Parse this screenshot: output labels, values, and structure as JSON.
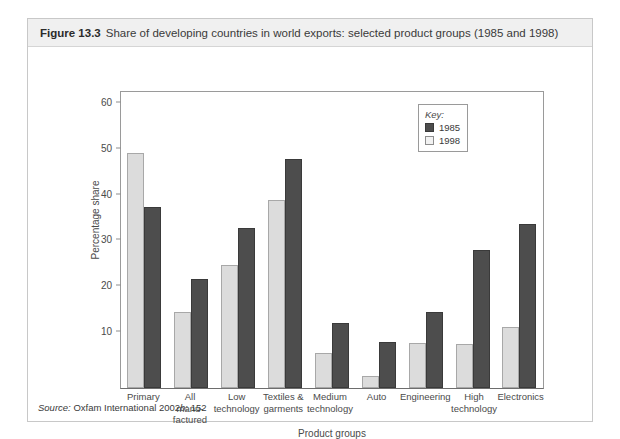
{
  "caption": {
    "figure_label": "Figure 13.3",
    "figure_text": "Share of developing countries in world exports: selected product groups (1985 and 1998)"
  },
  "source": {
    "label": "Source:",
    "text": "Oxfam International 2002",
    "italic_suffix": "b",
    "page": ": 152"
  },
  "legend": {
    "title": "Key:",
    "entries": [
      {
        "label": "1985",
        "color": "#4d4d4d"
      },
      {
        "label": "1998",
        "color": "#f2f2f2"
      }
    ]
  },
  "chart_data": {
    "type": "bar",
    "title": "Share of developing countries in world exports: selected product groups (1985 and 1998)",
    "xlabel": "Product groups",
    "ylabel": "Percentage share",
    "ylim": [
      0,
      65
    ],
    "yticks": [
      10,
      20,
      30,
      40,
      50,
      60
    ],
    "grid": false,
    "legend_position": "top-right",
    "categories": [
      "Primary",
      "All manu-factured",
      "Low technology",
      "Textiles & garments",
      "Medium technology",
      "Auto",
      "Engineering",
      "High technology",
      "Electronics"
    ],
    "category_lines": [
      [
        "Primary"
      ],
      [
        "All",
        "manu-",
        "factured"
      ],
      [
        "Low",
        "technology"
      ],
      [
        "Textiles &",
        "garments"
      ],
      [
        "Medium",
        "technology"
      ],
      [
        "Auto"
      ],
      [
        "Engineering"
      ],
      [
        "High",
        "technology"
      ],
      [
        "Electronics"
      ]
    ],
    "series": [
      {
        "name": "1998",
        "color": "#dcdcdc",
        "values": [
          51.3,
          16.5,
          26.8,
          41.0,
          7.7,
          2.7,
          9.8,
          9.7,
          13.2
        ]
      },
      {
        "name": "1985",
        "color": "#4d4d4d",
        "values": [
          39.4,
          23.8,
          34.8,
          50.0,
          14.2,
          10.0,
          16.5,
          30.0,
          35.8
        ]
      }
    ]
  }
}
